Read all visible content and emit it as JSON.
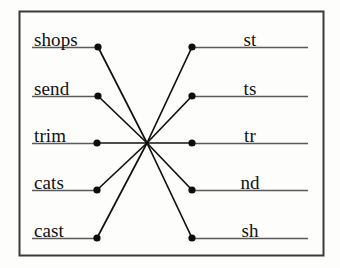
{
  "figure": {
    "name": "bipartite-word-feature-network",
    "border_color": "#3a3a3a",
    "line_color": "#5a5a5a",
    "edge_color": "#121212",
    "node_color": "#0d0d0d",
    "background": "#fdfdfc",
    "frame": {
      "x": 19,
      "y": 11,
      "width": 304,
      "height": 244
    }
  },
  "hub": {
    "label": "",
    "x": 147,
    "y": 143
  },
  "left_nodes": [
    {
      "label": "shops",
      "x": 98,
      "y": 47,
      "line_x1": 32,
      "line_x2": 98,
      "label_x": 34,
      "label_y": 30
    },
    {
      "label": "send",
      "x": 98,
      "y": 96,
      "line_x1": 32,
      "line_x2": 98,
      "label_x": 34,
      "label_y": 79
    },
    {
      "label": "trim",
      "x": 97,
      "y": 143,
      "line_x1": 32,
      "line_x2": 97,
      "label_x": 34,
      "label_y": 126
    },
    {
      "label": "cats",
      "x": 97,
      "y": 190,
      "line_x1": 32,
      "line_x2": 97,
      "label_x": 34,
      "label_y": 173
    },
    {
      "label": "cast",
      "x": 97,
      "y": 238,
      "line_x1": 32,
      "line_x2": 97,
      "label_x": 34,
      "label_y": 221
    }
  ],
  "right_nodes": [
    {
      "label": "st",
      "x": 192,
      "y": 47,
      "line_x1": 192,
      "line_x2": 308,
      "label_x": 250,
      "label_y": 30
    },
    {
      "label": "ts",
      "x": 192,
      "y": 96,
      "line_x1": 192,
      "line_x2": 308,
      "label_x": 250,
      "label_y": 79
    },
    {
      "label": "tr",
      "x": 192,
      "y": 143,
      "line_x1": 192,
      "line_x2": 308,
      "label_x": 250,
      "label_y": 126
    },
    {
      "label": "nd",
      "x": 192,
      "y": 190,
      "line_x1": 192,
      "line_x2": 308,
      "label_x": 250,
      "label_y": 173
    },
    {
      "label": "sh",
      "x": 192,
      "y": 238,
      "line_x1": 192,
      "line_x2": 308,
      "label_x": 250,
      "label_y": 221
    }
  ],
  "edges": [
    {
      "from": "shops",
      "to": "hub"
    },
    {
      "from": "send",
      "to": "hub"
    },
    {
      "from": "trim",
      "to": "hub"
    },
    {
      "from": "cats",
      "to": "hub"
    },
    {
      "from": "cast",
      "to": "hub"
    },
    {
      "from": "hub",
      "to": "st"
    },
    {
      "from": "hub",
      "to": "ts"
    },
    {
      "from": "hub",
      "to": "tr"
    },
    {
      "from": "hub",
      "to": "nd"
    },
    {
      "from": "hub",
      "to": "sh"
    }
  ]
}
